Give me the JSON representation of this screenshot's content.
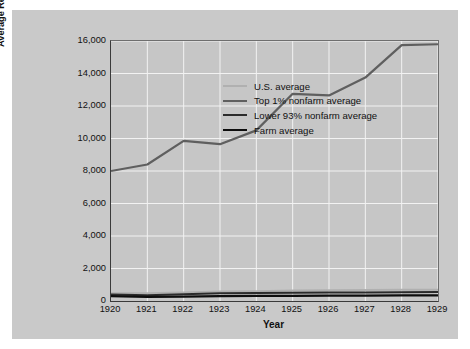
{
  "chart_data": {
    "type": "line",
    "title": "",
    "xlabel": "Year",
    "ylabel": "Average Real per Capita Disposable Income (1929 dollars)",
    "ylabel_line1": "Average Real per Capita Disposable Income",
    "ylabel_line2": "(1929 dollars)",
    "x": [
      1920,
      1921,
      1922,
      1923,
      1924,
      1925,
      1926,
      1927,
      1928,
      1929
    ],
    "xtick_labels": [
      "1920",
      "1921",
      "1922",
      "1923",
      "1924",
      "1925",
      "1926",
      "1927",
      "1928",
      "1929"
    ],
    "ytick_labels": [
      "0",
      "2,000",
      "4,000",
      "6,000",
      "8,000",
      "10,000",
      "12,000",
      "14,000",
      "16,000"
    ],
    "ytick_values": [
      0,
      2000,
      4000,
      6000,
      8000,
      10000,
      12000,
      14000,
      16000
    ],
    "xlim": [
      1920,
      1929
    ],
    "ylim": [
      0,
      16000
    ],
    "grid": true,
    "grid_color": "#f2f2f2",
    "legend_position": "upper-left",
    "plot_background": "#c6c6c6",
    "figure_background": "#c9c9c9",
    "series": [
      {
        "name": "U.S. average",
        "color": "#b0b0b0",
        "width": 2.0,
        "values": [
          480,
          470,
          520,
          590,
          600,
          640,
          660,
          670,
          690,
          700
        ]
      },
      {
        "name": "Top 1% nonfarm average",
        "color": "#5f5f5f",
        "width": 2.2,
        "values": [
          8000,
          8400,
          9850,
          9650,
          10500,
          12750,
          12650,
          13750,
          15750,
          15800
        ]
      },
      {
        "name": "Lower 93% nonfarm average",
        "color": "#2b2b2b",
        "width": 2.0,
        "values": [
          400,
          360,
          420,
          470,
          490,
          510,
          520,
          530,
          545,
          555
        ]
      },
      {
        "name": "Farm average",
        "color": "#0d0d0d",
        "width": 2.2,
        "values": [
          300,
          250,
          270,
          300,
          310,
          320,
          325,
          330,
          340,
          350
        ]
      }
    ]
  }
}
